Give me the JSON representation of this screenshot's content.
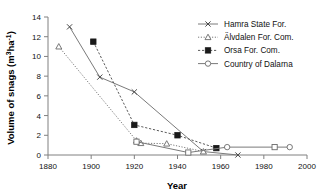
{
  "chart_data": {
    "type": "line",
    "title": "",
    "xlabel": "Year",
    "ylabel": "Volume of snags (m³ha⁻¹)",
    "ylabel_parts": {
      "main": "Volume of snags (m",
      "sup1": "3",
      "mid": "ha",
      "sup2": "-1",
      "tail": ")"
    },
    "xlim": [
      1880,
      2000
    ],
    "ylim": [
      0,
      14
    ],
    "xticks": [
      1880,
      1900,
      1920,
      1940,
      1960,
      1980,
      2000
    ],
    "yticks": [
      0,
      2,
      4,
      6,
      8,
      10,
      12,
      14
    ],
    "grid": false,
    "legend_position": "right-top",
    "series": [
      {
        "name": "Hamra State For.",
        "marker": "x-cross",
        "line_style": "solid",
        "points": [
          {
            "x": 1890,
            "y": 13.0
          },
          {
            "x": 1904,
            "y": 7.9
          },
          {
            "x": 1920,
            "y": 6.4
          },
          {
            "x": 1952,
            "y": 0.35
          },
          {
            "x": 1968,
            "y": 0.0
          }
        ]
      },
      {
        "name": "Älvdalen For. Com.",
        "marker": "triangle-open",
        "line_style": "dotted",
        "points": [
          {
            "x": 1885,
            "y": 11.0
          },
          {
            "x": 1921,
            "y": 1.45
          },
          {
            "x": 1923,
            "y": 1.2
          },
          {
            "x": 1935,
            "y": 1.15
          },
          {
            "x": 1952,
            "y": 0.35
          }
        ]
      },
      {
        "name": "Orsa For. Com.",
        "marker": "square-filled",
        "line_style": "dashed",
        "points": [
          {
            "x": 1901,
            "y": 11.5
          },
          {
            "x": 1920,
            "y": 3.05
          },
          {
            "x": 1940,
            "y": 2.0
          },
          {
            "x": 1958,
            "y": 0.7
          }
        ]
      },
      {
        "name": "Country of Dalarna",
        "marker": "circle-open",
        "line_style": "solid",
        "points": [
          {
            "x": 1921,
            "y": 1.35
          },
          {
            "x": 1945,
            "y": 0.25
          },
          {
            "x": 1963,
            "y": 0.8
          },
          {
            "x": 1985,
            "y": 0.8
          },
          {
            "x": 1992,
            "y": 0.8
          }
        ]
      }
    ]
  },
  "colors": {
    "axis": "#808080",
    "text": "#111111",
    "line_gray": "#7a7a7a",
    "marker_dark": "#1a1a1a",
    "background": "#ffffff"
  }
}
